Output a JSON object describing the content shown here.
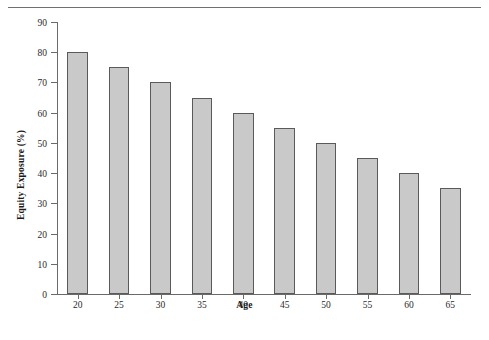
{
  "figure": {
    "has_top_rule": true,
    "background_color": "#ffffff",
    "bar_fill_color": "#c9c9c9",
    "bar_border_color": "#5a5a5a",
    "axis_color": "#6a6a6a"
  },
  "chart_data": {
    "type": "bar",
    "title": "",
    "xlabel": "Age",
    "ylabel": "Equity Exposure (%)",
    "categories": [
      "20",
      "25",
      "30",
      "35",
      "40",
      "45",
      "50",
      "55",
      "60",
      "65"
    ],
    "values": [
      80,
      75,
      70,
      65,
      60,
      55,
      50,
      45,
      40,
      35
    ],
    "ylim": [
      0,
      90
    ],
    "yticks": [
      0,
      10,
      20,
      30,
      40,
      50,
      60,
      70,
      80,
      90
    ],
    "ytick_labels": [
      "0",
      "10",
      "20",
      "30",
      "40",
      "50",
      "60",
      "70",
      "80",
      "90"
    ],
    "xtick_labels": [
      "20",
      "25",
      "30",
      "35",
      "40",
      "45",
      "50",
      "55",
      "60",
      "65"
    ],
    "grid": false,
    "legend": null,
    "series": [
      {
        "name": "Equity Exposure",
        "values": [
          80,
          75,
          70,
          65,
          60,
          55,
          50,
          45,
          40,
          35
        ]
      }
    ]
  }
}
